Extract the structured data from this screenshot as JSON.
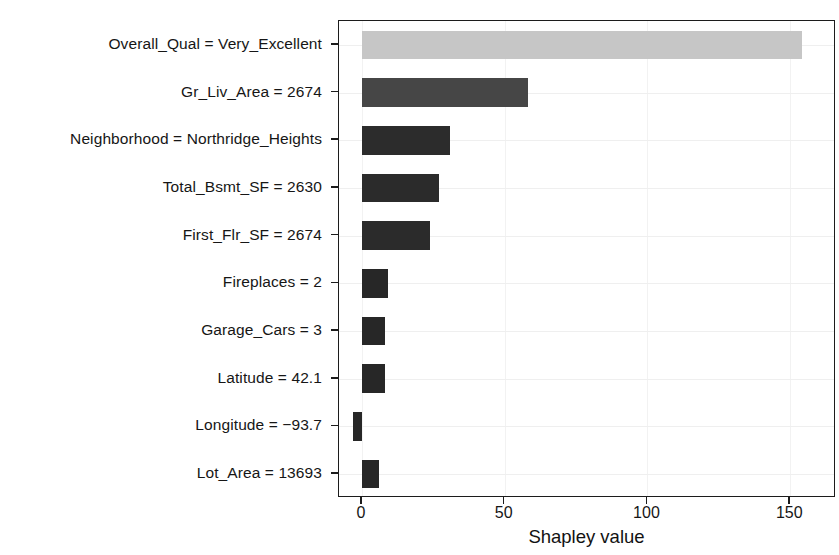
{
  "chart_data": {
    "type": "bar",
    "orientation": "horizontal",
    "title": "",
    "subtitle": "",
    "xlabel": "Shapley value",
    "ylabel": "",
    "xlim": [
      -8,
      166
    ],
    "xticks": [
      0,
      50,
      100,
      150
    ],
    "xticklabels": [
      "0",
      "50",
      "100",
      "150"
    ],
    "grid": "light gray gridlines at tick positions",
    "legend": "none",
    "categories": [
      "Overall_Qual = Very_Excellent",
      "Gr_Liv_Area = 2674",
      "Neighborhood = Northridge_Heights",
      "Total_Bsmt_SF = 2630",
      "First_Flr_SF = 2674",
      "Fireplaces = 2",
      "Garage_Cars = 3",
      "Latitude = 42.1",
      "Longitude = −93.7",
      "Lot_Area = 13693"
    ],
    "values": [
      154,
      58,
      31,
      27,
      24,
      9,
      8,
      8,
      -3,
      6
    ],
    "bar_colors": [
      "#c6c6c6",
      "#464646",
      "#2c2c2c",
      "#2b2b2b",
      "#2b2b2b",
      "#272727",
      "#272727",
      "#272727",
      "#272727",
      "#272727"
    ],
    "annotations": []
  },
  "axis": {
    "x_title": "Shapley value"
  },
  "style": {
    "panel_border": "#1c1c1c",
    "grid_color": "#efefef",
    "text_color": "#161616",
    "background": "#ffffff"
  }
}
